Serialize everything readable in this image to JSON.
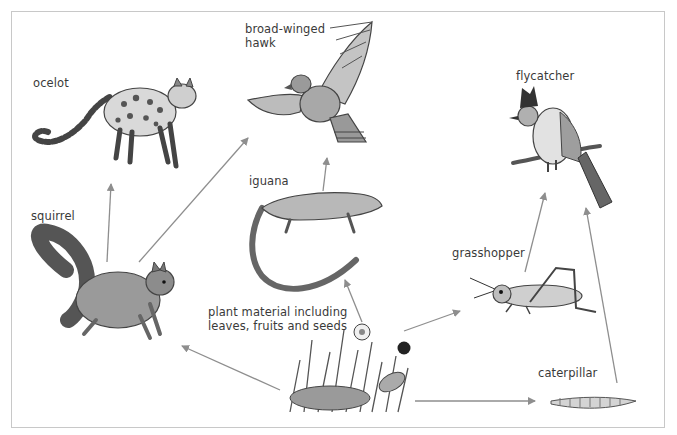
{
  "diagram": {
    "type": "food-web",
    "frame_color": "#c8c8c8",
    "arrow_color": "#8e8e8e",
    "organisms": [
      {
        "id": "ocelot",
        "label": "ocelot",
        "x": 33,
        "y": 76
      },
      {
        "id": "hawk",
        "label": "broad-winged\nhawk",
        "x": 245,
        "y": 22
      },
      {
        "id": "flycatcher",
        "label": "flycatcher",
        "x": 516,
        "y": 69
      },
      {
        "id": "squirrel",
        "label": "squirrel",
        "x": 31,
        "y": 209
      },
      {
        "id": "iguana",
        "label": "iguana",
        "x": 249,
        "y": 174
      },
      {
        "id": "grasshopper",
        "label": "grasshopper",
        "x": 452,
        "y": 246
      },
      {
        "id": "plant",
        "label": "plant material including\nleaves, fruits and seeds",
        "x": 208,
        "y": 305
      },
      {
        "id": "caterpillar",
        "label": "caterpillar",
        "x": 538,
        "y": 366
      }
    ],
    "links": [
      {
        "from": "squirrel",
        "to": "ocelot"
      },
      {
        "from": "squirrel",
        "to": "hawk"
      },
      {
        "from": "iguana",
        "to": "hawk"
      },
      {
        "from": "grasshopper",
        "to": "flycatcher"
      },
      {
        "from": "caterpillar",
        "to": "flycatcher"
      },
      {
        "from": "plant",
        "to": "squirrel"
      },
      {
        "from": "plant",
        "to": "iguana"
      },
      {
        "from": "plant",
        "to": "grasshopper"
      },
      {
        "from": "plant",
        "to": "caterpillar"
      }
    ]
  }
}
